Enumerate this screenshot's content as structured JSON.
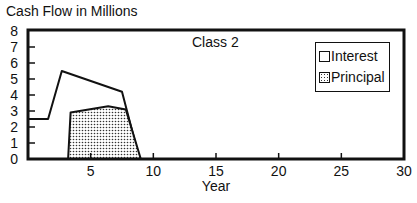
{
  "chart_data": {
    "type": "area",
    "title": "Cash Flow in Millions",
    "subtitle": "Class 2",
    "xlabel": "Year",
    "ylabel": "Cash Flow in Millions",
    "xlim": [
      0,
      30
    ],
    "ylim": [
      0,
      8
    ],
    "x_ticks": [
      5,
      10,
      15,
      20,
      25,
      30
    ],
    "y_ticks": [
      0,
      1,
      2,
      3,
      4,
      5,
      6,
      7,
      8
    ],
    "grid": false,
    "legend_position": "upper right",
    "series": [
      {
        "name": "Interest",
        "fill": "none",
        "points": [
          [
            0,
            2.5
          ],
          [
            1.6,
            2.5
          ],
          [
            2.7,
            5.5
          ],
          [
            7.5,
            4.2
          ],
          [
            8.9,
            0
          ]
        ]
      },
      {
        "name": "Principal",
        "fill": "dotted",
        "points": [
          [
            3.2,
            0
          ],
          [
            3.4,
            2.9
          ],
          [
            6.4,
            3.3
          ],
          [
            7.8,
            3.1
          ],
          [
            9.0,
            0
          ]
        ]
      }
    ]
  },
  "labels": {
    "title": "Cash Flow in Millions",
    "class": "Class 2",
    "xlabel": "Year",
    "legend": [
      "Interest",
      "Principal"
    ],
    "yticks": [
      "0",
      "1",
      "2",
      "3",
      "4",
      "5",
      "6",
      "7",
      "8"
    ],
    "xticks": [
      "5",
      "10",
      "15",
      "20",
      "25",
      "30"
    ]
  }
}
